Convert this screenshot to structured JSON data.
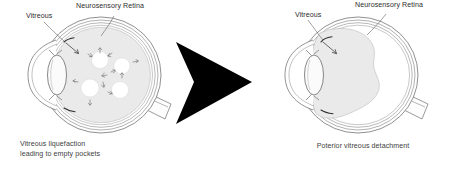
{
  "figure": {
    "background_color": "#ffffff",
    "ink_color": "#3a3a3a",
    "vitreous_fill_color": "#eaeaea",
    "pocket_fill_color": "#ffffff",
    "arrow_color": "#000000"
  },
  "panels": [
    {
      "id": "left",
      "caption": "Vitreous liquefaction\nleading to empty pockets",
      "labels": [
        {
          "id": "vitreous",
          "text": "Vitreous"
        },
        {
          "id": "retina",
          "text": "Neurosensory Retina"
        }
      ],
      "stage": "liquefaction",
      "pocket_count": 4
    },
    {
      "id": "right",
      "caption": "Poterior vitreous detachment",
      "labels": [
        {
          "id": "vitreous",
          "text": "Vitreous"
        },
        {
          "id": "retina",
          "text": "Neurosensory Retina"
        }
      ],
      "stage": "detachment",
      "pocket_count": 0
    }
  ],
  "transition_arrow": {
    "name": "progression-arrow",
    "direction": "right",
    "color": "#000000"
  }
}
